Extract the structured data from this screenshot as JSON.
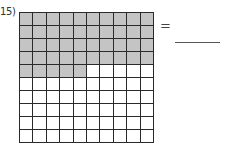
{
  "problem": {
    "number_label": "15)",
    "equals_sign": "=",
    "answer_value": ""
  },
  "grid": {
    "rows": 10,
    "columns": 10,
    "total_cells": 100,
    "shaded_cells": 45,
    "shaded_full_rows": 4,
    "shaded_partial_row_cells": 5,
    "colors": {
      "shaded": "#c4c4c4",
      "unshaded": "#ffffff",
      "lines": "#2a2a2a"
    }
  }
}
